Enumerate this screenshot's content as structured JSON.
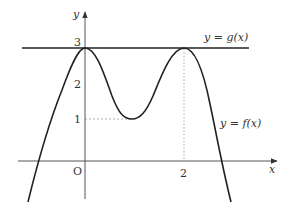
{
  "figure": {
    "type": "function-graph",
    "axes": {
      "x_label": "x",
      "y_label": "y",
      "origin_label": "O",
      "x_ticks": [
        {
          "value": 2,
          "label": "2"
        }
      ],
      "y_ticks": [
        {
          "value": 1,
          "label": "1"
        },
        {
          "value": 2,
          "label": "2"
        },
        {
          "value": 3,
          "label": "3"
        }
      ]
    },
    "curves": [
      {
        "name": "f",
        "label": "y = f(x)",
        "description": "quartic-like curve with local maxima at x=0 and x=2 (value 3) and local minimum at x=1 (value 1)",
        "key_points": [
          {
            "x": 0,
            "y": 3,
            "kind": "local-max"
          },
          {
            "x": 1,
            "y": 1,
            "kind": "local-min"
          },
          {
            "x": 2,
            "y": 3,
            "kind": "local-max"
          }
        ]
      },
      {
        "name": "g",
        "label": "y = g(x)",
        "description": "horizontal line y = 3",
        "value": 3
      }
    ],
    "guides": [
      {
        "kind": "dashed-horizontal",
        "y": 1,
        "from_x": 0,
        "to_x": 1
      },
      {
        "kind": "dotted-vertical",
        "x": 2,
        "from_y": 0,
        "to_y": 3
      }
    ],
    "colors": {
      "curve": "#222222",
      "axis": "#555555",
      "guide": "#999999",
      "text": "#333333"
    }
  }
}
